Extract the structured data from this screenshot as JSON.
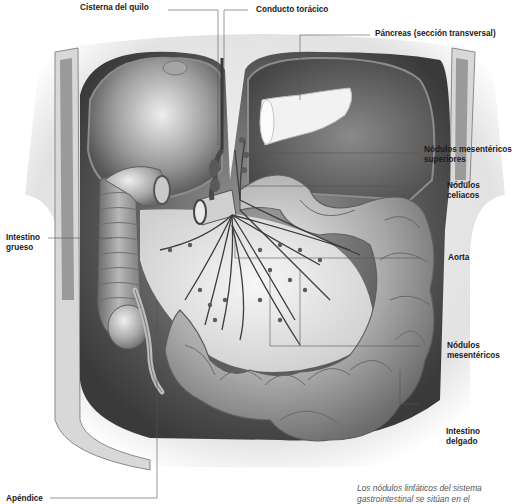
{
  "figure": {
    "type": "anatomical-illustration"
  },
  "labels": {
    "cisterna": "Cisterna del quilo",
    "conducto": "Conducto torácico",
    "pancreas": "Páncreas (sección transversal)",
    "nod_mes_sup_1": "Nódulos mesentéricos",
    "nod_mes_sup_2": "superiores",
    "nod_cel_1": "Nódulos",
    "nod_cel_2": "celiacos",
    "intestino_grueso_1": "Intestino",
    "intestino_grueso_2": "grueso",
    "aorta": "Aorta",
    "nod_mes_1": "Nódulos",
    "nod_mes_2": "mesentéricos",
    "intestino_delgado_1": "Intestino",
    "intestino_delgado_2": "delgado",
    "apendice": "Apéndice"
  },
  "caption": {
    "line1": "Los nódulos linfáticos del sistema",
    "line2": "gastrointestinal se sitúan en el"
  },
  "colors": {
    "background": "#ffffff",
    "label_text": "#1a1a1a",
    "leader_line": "#555555",
    "caption_text": "#555555"
  }
}
